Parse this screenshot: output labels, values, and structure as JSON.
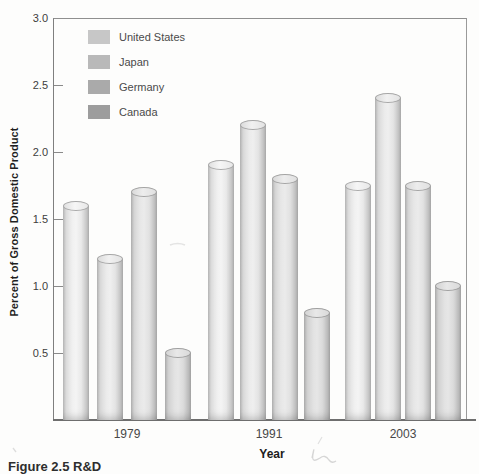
{
  "figure": {
    "caption": "Figure 2.5 R&D",
    "xlabel": "Year",
    "ylabel": "Percent of Gross Domestic Product"
  },
  "chart_data": {
    "type": "bar",
    "title": "",
    "categories": [
      "1979",
      "1991",
      "2003"
    ],
    "series": [
      {
        "name": "United States",
        "legend_color": "#c7c7c7",
        "values": [
          1.6,
          1.9,
          1.75
        ]
      },
      {
        "name": "Japan",
        "legend_color": "#b9b9b9",
        "values": [
          1.2,
          2.2,
          2.4
        ]
      },
      {
        "name": "Germany",
        "legend_color": "#aaaaaa",
        "values": [
          1.7,
          1.8,
          1.75
        ]
      },
      {
        "name": "Canada",
        "legend_color": "#9d9d9d",
        "values": [
          0.5,
          0.8,
          1.0
        ]
      }
    ],
    "xlabel": "Year",
    "ylabel": "Percent of Gross Domestic Product",
    "ylim": [
      0,
      3.0
    ],
    "ytick_labels": [
      "3.0",
      "2.5",
      "2.0",
      "1.5",
      "1.0",
      "0.5"
    ],
    "yticks": [
      3.0,
      2.5,
      2.0,
      1.5,
      1.0,
      0.5
    ],
    "legend_position": "top-left",
    "grid": false,
    "bar_style": "3d-cylinder-gray"
  }
}
